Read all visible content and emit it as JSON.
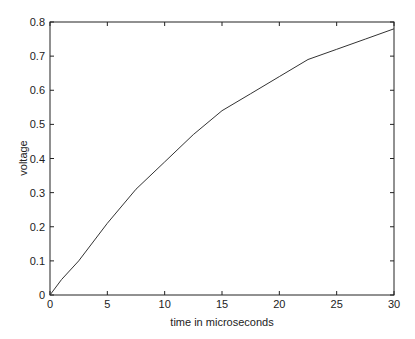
{
  "chart_data": {
    "type": "line",
    "title": "",
    "xlabel": "time in microseconds",
    "ylabel": "voltage",
    "xlim": [
      0,
      30
    ],
    "ylim": [
      0,
      0.8
    ],
    "xticks": [
      0,
      5,
      10,
      15,
      20,
      25,
      30
    ],
    "yticks": [
      0,
      0.1,
      0.2,
      0.3,
      0.4,
      0.5,
      0.6,
      0.7,
      0.8
    ],
    "grid": false,
    "legend": null,
    "series": [
      {
        "name": "voltage",
        "x": [
          0,
          1,
          2.5,
          5,
          7.5,
          10,
          12.5,
          15,
          17.5,
          20,
          22.5,
          25,
          27.5,
          30
        ],
        "values": [
          0,
          0.045,
          0.1,
          0.21,
          0.31,
          0.39,
          0.47,
          0.54,
          0.59,
          0.64,
          0.69,
          0.72,
          0.75,
          0.78
        ]
      }
    ]
  }
}
